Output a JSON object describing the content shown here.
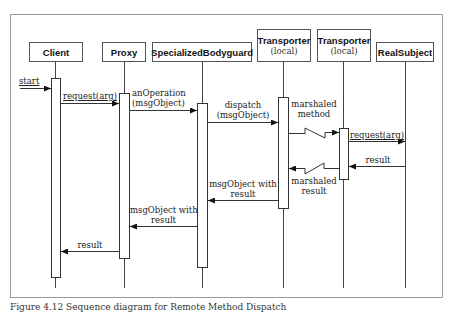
{
  "diagram": {
    "type": "uml-sequence",
    "participants": [
      {
        "id": "client",
        "name": "Client",
        "sub": ""
      },
      {
        "id": "proxy",
        "name": "Proxy",
        "sub": ""
      },
      {
        "id": "bodyguard",
        "name": "SpecializedBodyguard",
        "sub": ""
      },
      {
        "id": "transporter1",
        "name": "Transporter",
        "sub": "(local)"
      },
      {
        "id": "transporter2",
        "name": "Transporter",
        "sub": "(local)"
      },
      {
        "id": "realsubject",
        "name": "RealSubject",
        "sub": ""
      }
    ],
    "messages": [
      {
        "from": "external",
        "to": "client",
        "label": "start",
        "kind": "sync"
      },
      {
        "from": "client",
        "to": "proxy",
        "label": "request(arg)",
        "kind": "sync"
      },
      {
        "from": "proxy",
        "to": "bodyguard",
        "label_line1": "anOperation",
        "label_line2": "(msgObject)",
        "kind": "sync"
      },
      {
        "from": "bodyguard",
        "to": "transporter1",
        "label_line1": "dispatch",
        "label_line2": "(msgObject)",
        "kind": "sync"
      },
      {
        "from": "transporter1",
        "to": "transporter2",
        "label_line1": "marshaled",
        "label_line2": "method",
        "kind": "remote"
      },
      {
        "from": "transporter2",
        "to": "realsubject",
        "label": "request(arg)",
        "kind": "sync"
      },
      {
        "from": "realsubject",
        "to": "transporter2",
        "label": "result",
        "kind": "return"
      },
      {
        "from": "transporter2",
        "to": "transporter1",
        "label_line1": "marshaled",
        "label_line2": "result",
        "kind": "remote-return"
      },
      {
        "from": "transporter1",
        "to": "bodyguard",
        "label_line1": "msgObject with",
        "label_line2": "result",
        "kind": "return"
      },
      {
        "from": "bodyguard",
        "to": "proxy",
        "label_line1": "msgObject with",
        "label_line2": "result",
        "kind": "return"
      },
      {
        "from": "proxy",
        "to": "client",
        "label": "result",
        "kind": "return"
      }
    ]
  },
  "caption": {
    "text": "Figure 4.12  Sequence diagram for Remote Method Dispatch"
  }
}
